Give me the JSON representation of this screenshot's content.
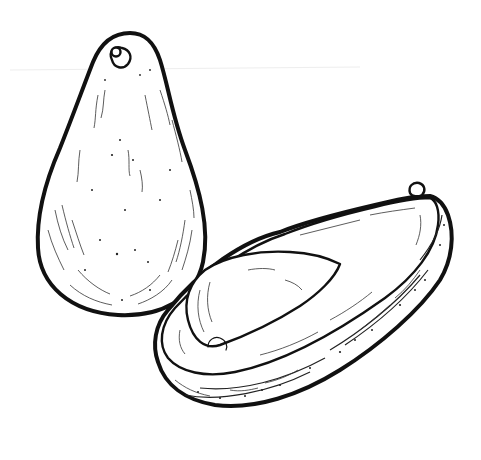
{
  "image": {
    "subject": "Hand-drawn black ink line illustration of avocados",
    "style": "pen and ink sketch, black on white",
    "colors": {
      "background": "#ffffff",
      "ink": "#111111"
    },
    "elements": [
      {
        "name": "whole-avocado",
        "description": "Whole upright pear-shaped avocado with stem nub at top, textured skin"
      },
      {
        "name": "halved-avocado",
        "description": "Avocado half lying diagonally, showing pit in cavity and rough skin edge, small stem at right tip"
      }
    ]
  }
}
